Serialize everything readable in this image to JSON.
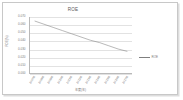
{
  "chart_data": {
    "type": "line",
    "title": "ROE",
    "xlabel": "年度(年)",
    "ylabel": "ROE(%)",
    "grid": true,
    "legend_position": "right",
    "legend": [
      "ROE"
    ],
    "categories": [
      "2007年",
      "2008年",
      "2009年",
      "2010年",
      "2011年",
      "2012年",
      "2013年",
      "2014年",
      "2015年",
      "2016年",
      "2017年"
    ],
    "series": [
      {
        "name": "ROE",
        "values": [
          0.065,
          0.061,
          0.057,
          0.053,
          0.049,
          0.045,
          0.041,
          0.038,
          0.034,
          0.03,
          0.027
        ]
      }
    ],
    "ytick_labels": [
      "0.070",
      "0.060",
      "0.050",
      "0.040",
      "0.030",
      "0.020",
      "0.010",
      "0.000"
    ],
    "ytick_values": [
      0.07,
      0.06,
      0.05,
      0.04,
      0.03,
      0.02,
      0.01,
      0.0
    ],
    "ylim": [
      0.0,
      0.07
    ],
    "colors": {
      "series_line": "#7f7f7f",
      "gridline": "#e2e2e2",
      "axis": "#b9b9b9",
      "text": "#7a7a7a",
      "frame": "#c8c8c8",
      "background": "#ffffff"
    }
  }
}
